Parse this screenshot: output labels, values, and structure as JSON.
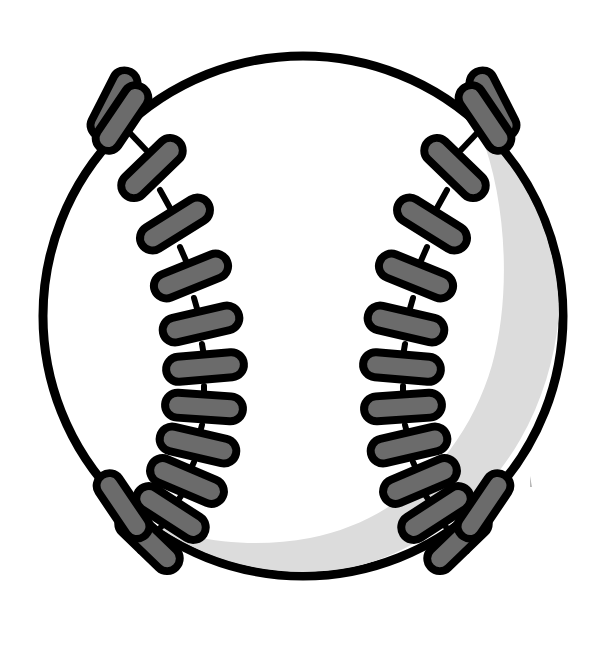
{
  "illustration": {
    "title": "Baseball",
    "subject": "baseball-clipart",
    "style": "flat vector clip art, black outline, grayscale",
    "canvas": {
      "width": 607,
      "height": 645,
      "background": "#ffffff"
    }
  },
  "colors": {
    "background": "#ffffff",
    "ball_fill": "#ffffff",
    "outline": "#000000",
    "shadow": "#dcdcdc",
    "stitch_fill": "#6b6b6b",
    "stitch_outline": "#000000",
    "speck": "#b8b8b8"
  },
  "ball": {
    "label": "baseball-body",
    "center_x": 303,
    "center_y": 316,
    "radius": 260,
    "fill": "#ffffff",
    "stroke": "#000000",
    "stroke_width": 9
  },
  "shadow": {
    "label": "inner-shading-crescent",
    "fill": "#dcdcdc",
    "description": "light gray crescent hugging the inner right and bottom-right rim"
  },
  "speck": {
    "label": "stray-mark",
    "x": 530,
    "y": 481,
    "width": 3,
    "height": 11
  },
  "stitch_style": {
    "capsule_length": 78,
    "capsule_thickness": 25,
    "corner_radius": 12.5,
    "fill": "#6b6b6b",
    "stroke": "#000000",
    "stroke_width": 8,
    "connector_stroke_width": 6
  },
  "seams": [
    {
      "name": "left-seam",
      "side": "left",
      "count": 13,
      "stitches": [
        {
          "cx": 120,
          "cy": 112,
          "angle": -56,
          "len": 74
        },
        {
          "cx": 151,
          "cy": 167,
          "angle": -43,
          "len": 76
        },
        {
          "cx": 174,
          "cy": 223,
          "angle": -32,
          "len": 78
        },
        {
          "cx": 190,
          "cy": 275,
          "angle": -22,
          "len": 79
        },
        {
          "cx": 200,
          "cy": 323,
          "angle": -13,
          "len": 80
        },
        {
          "cx": 204,
          "cy": 366,
          "angle": -5,
          "len": 80
        },
        {
          "cx": 203,
          "cy": 406,
          "angle": 4,
          "len": 80
        },
        {
          "cx": 197,
          "cy": 444,
          "angle": 13,
          "len": 80
        },
        {
          "cx": 186,
          "cy": 480,
          "angle": 23,
          "len": 79
        },
        {
          "cx": 170,
          "cy": 512,
          "angle": 33,
          "len": 78
        },
        {
          "cx": 148,
          "cy": 540,
          "angle": 44,
          "len": 76
        },
        {
          "cx": 122,
          "cy": 505,
          "angle": 57,
          "len": 74
        },
        {
          "cx": 114,
          "cy": 102,
          "angle": -63,
          "len": 72
        }
      ]
    },
    {
      "name": "right-seam",
      "side": "right",
      "count": 13,
      "mirror_of": "left-seam"
    }
  ],
  "meta": {
    "shape_kind": "sports-equipment",
    "symmetry": "bilateral-vertical"
  }
}
